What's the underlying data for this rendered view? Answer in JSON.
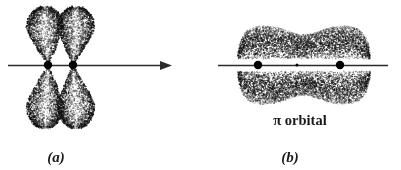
{
  "figure": {
    "background_color": "#ffffff",
    "ink_color": "#1a1a1a",
    "width": 401,
    "height": 170,
    "panels": [
      {
        "id": "panel-a",
        "label": "(a)",
        "label_x": 56,
        "label_y": 150,
        "caption": "",
        "description": "two adjacent p orbitals, each with an upper and lower teardrop lobe, drawn as stippled clouds, with two nuclei on a horizontal bond axis ending in a right-pointing arrowhead",
        "axis": {
          "x1": 8,
          "x2": 172,
          "y": 65,
          "stroke_width": 1.6,
          "color": "#2b2b2b",
          "arrow": true,
          "arrow_side": "right",
          "arrow_length": 12,
          "arrow_half_height": 4.4
        },
        "nuclei": [
          {
            "cx": 48,
            "cy": 65,
            "r": 4.2
          },
          {
            "cx": 73,
            "cy": 65,
            "r": 4.2
          }
        ],
        "lobes": [
          {
            "name": "left-upper-lobe",
            "cx": 45,
            "tip_x": 48,
            "tip_y": 63,
            "top_y": 7,
            "half_width": 19,
            "widest_frac": 0.62,
            "dir": "up",
            "points": 2100
          },
          {
            "name": "right-upper-lobe",
            "cx": 76,
            "tip_x": 73,
            "tip_y": 63,
            "top_y": 7,
            "half_width": 19,
            "widest_frac": 0.62,
            "dir": "up",
            "points": 2100
          },
          {
            "name": "left-lower-lobe",
            "cx": 45,
            "tip_x": 48,
            "tip_y": 67,
            "top_y": 128,
            "half_width": 19,
            "widest_frac": 0.62,
            "dir": "down",
            "points": 2100
          },
          {
            "name": "right-lower-lobe",
            "cx": 76,
            "tip_x": 73,
            "tip_y": 67,
            "top_y": 128,
            "half_width": 19,
            "widest_frac": 0.62,
            "dir": "down",
            "points": 2100
          }
        ]
      },
      {
        "id": "panel-b",
        "label": "(b)",
        "label_x": 290,
        "label_y": 150,
        "caption": "π orbital",
        "description": "merged pi molecular orbital: one continuous stippled cloud above the bond axis and a mirror cloud below, pinched at the midpoint, with two nuclei and a small midpoint node dot on the axis",
        "axis": {
          "x1": 218,
          "x2": 388,
          "y": 65,
          "stroke_width": 1.6,
          "color": "#2b2b2b",
          "arrow": false,
          "arrow_side": "",
          "arrow_length": 0,
          "arrow_half_height": 0
        },
        "nuclei": [
          {
            "cx": 258,
            "cy": 65,
            "r": 4.2
          },
          {
            "cx": 340,
            "cy": 65,
            "r": 4.2
          }
        ],
        "node_dot": {
          "cx": 297,
          "cy": 65,
          "r": 1.5
        },
        "clouds": [
          {
            "name": "upper-pi-cloud",
            "x1": 238,
            "x2": 370,
            "near_y": 59,
            "far_y": 25,
            "waist_pinch": 0.72,
            "dir": "up",
            "points": 5200
          },
          {
            "name": "lower-pi-cloud",
            "x1": 238,
            "x2": 370,
            "near_y": 71,
            "far_y": 105,
            "waist_pinch": 0.72,
            "dir": "down",
            "points": 5200
          }
        ]
      }
    ]
  }
}
